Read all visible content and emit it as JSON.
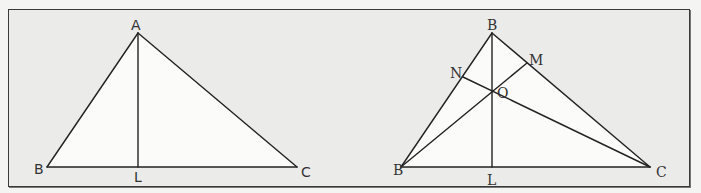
{
  "figure": {
    "type": "geometry-diagram",
    "panels": [
      {
        "id": "left",
        "description": "Triangle ABC with altitude AL drawn from A to BC",
        "labels": {
          "A": "A",
          "B": "B",
          "C": "C",
          "L": "L"
        },
        "segments": [
          "AB",
          "AC",
          "BC",
          "AL"
        ]
      },
      {
        "id": "right",
        "description": "Triangle with three altitudes BL, BM (from left base vertex), CN meeting at orthocenter O",
        "labels": {
          "B_top": "B",
          "B_left": "B",
          "C": "C",
          "L": "L",
          "M": "M",
          "N": "N",
          "O": "O"
        },
        "segments": [
          "B_top-B_left",
          "B_top-C",
          "B_left-C",
          "B_top-L",
          "B_left-M",
          "C-N"
        ]
      }
    ],
    "colors": {
      "line": "#222222",
      "frame": "#3a3a3a",
      "background": "#ebebea",
      "triangle_fill": "#fbfbfa",
      "label": "#333333"
    }
  }
}
